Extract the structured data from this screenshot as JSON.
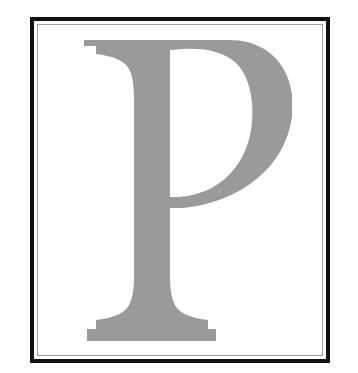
{
  "document": {
    "title": "Framed Letter Plate",
    "background_color": "#ffffff"
  },
  "frame": {
    "name": "decorative-double-rule-frame",
    "outer_border_color": "#101010",
    "outer_border_width_px": 4,
    "gap_color": "#ffffff",
    "gap_width_px": 3,
    "hairline_color": "#9e9e9e",
    "hairline_width_px": 1,
    "interior_color": "#ffffff",
    "left_px": 30,
    "top_px": 17,
    "width_px": 300,
    "height_px": 346
  },
  "glyph": {
    "character": "P",
    "name": "capital-letter-p",
    "style": "serif",
    "weight": "regular",
    "fill_color": "#9a9a9a",
    "bounds": {
      "left_px": 82,
      "top_px": 58,
      "right_px": 276,
      "bottom_px": 318
    }
  }
}
